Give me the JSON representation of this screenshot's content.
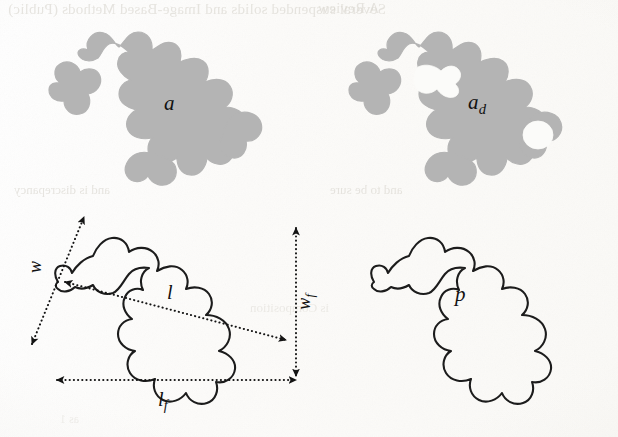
{
  "figure": {
    "caption_present": false,
    "background_color": "#fdfdfb",
    "blob_fill_color": "#b4b4b4",
    "outline_color": "#1c1c1c",
    "ghost_text_color": "#d9d6cf"
  },
  "panels": {
    "top_left": {
      "name": "filled-area-blob",
      "label": "a",
      "label_subscript": "",
      "style": "solid-gray-fill",
      "holes": 0
    },
    "top_right": {
      "name": "filled-area-blob-with-defects",
      "label": "a",
      "label_subscript": "d",
      "style": "solid-gray-fill",
      "holes": 2
    },
    "bottom_left": {
      "name": "outline-blob-with-dimensions",
      "label": "",
      "style": "black-outline",
      "dimensions": [
        {
          "id": "w",
          "label": "w",
          "subscript": "",
          "orientation": "diagonal-minor-axis",
          "arrow": "double"
        },
        {
          "id": "l",
          "label": "l",
          "subscript": "",
          "orientation": "diagonal-major-axis",
          "arrow": "double"
        },
        {
          "id": "wf",
          "label": "w",
          "subscript": "f",
          "orientation": "vertical",
          "arrow": "double"
        },
        {
          "id": "lf",
          "label": "l",
          "subscript": "f",
          "orientation": "horizontal",
          "arrow": "double"
        }
      ]
    },
    "bottom_right": {
      "name": "outline-blob-perimeter",
      "label": "p",
      "label_subscript": "",
      "style": "black-outline",
      "holes": 0
    }
  },
  "ghost_text": {
    "top_left": "Several suspended solids and Image-Based Methods (Public)",
    "top_right": "A Review",
    "mid_left": "and is discrepancy",
    "mid_right": "and to be sure",
    "low_left": "is Composition",
    "low_right": "as 1"
  }
}
